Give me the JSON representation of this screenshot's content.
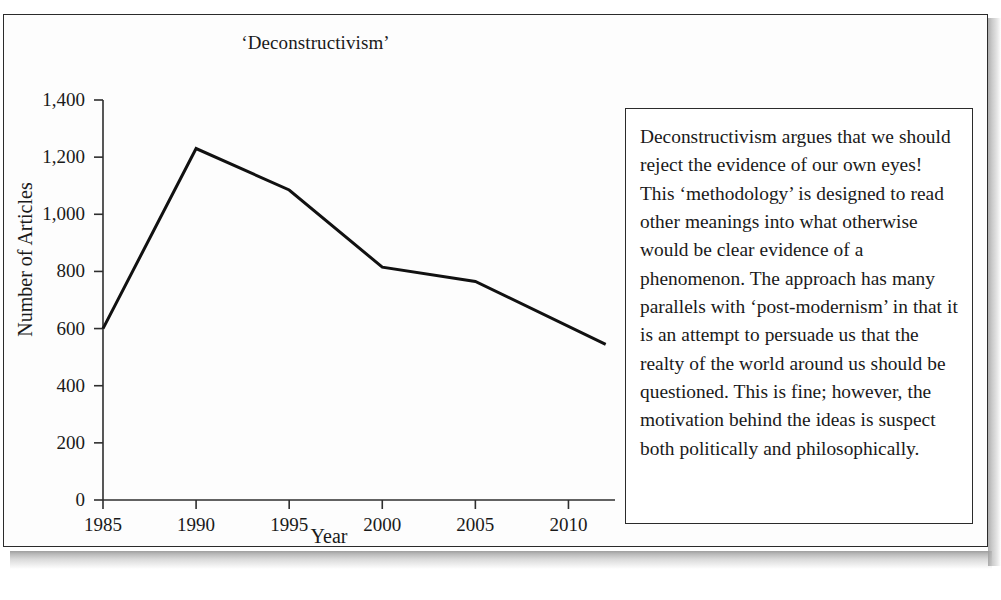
{
  "figure": {
    "title": "‘Deconstructivism’",
    "sidebar_text": "Deconstructivism argues that we should reject the evidence of our own eyes! This ‘methodology’ is designed to read other meanings into what otherwise would be clear evidence of a phenomenon. The approach has many parallels with ‘post-modernism’ in that it is an attempt to persuade us that the realty of the world around us should be questioned. This is fine; however, the motivation behind the ideas is suspect both politically and philosophically."
  },
  "chart_data": {
    "type": "line",
    "title": "‘Deconstructivism’",
    "xlabel": "Year",
    "ylabel": "Number of Articles",
    "x": [
      1985,
      1990,
      1995,
      2000,
      2005,
      2012
    ],
    "values": [
      600,
      1230,
      1085,
      815,
      765,
      545
    ],
    "series": [
      {
        "name": "Number of Articles",
        "values": [
          600,
          1230,
          1085,
          815,
          765,
          545
        ]
      }
    ],
    "xlim": [
      1985,
      2012.5
    ],
    "ylim": [
      0,
      1400
    ],
    "xticks": [
      1985,
      1990,
      1995,
      2000,
      2005,
      2010
    ],
    "xtick_labels": [
      "1985",
      "1990",
      "1995",
      "2000",
      "2005",
      "2010"
    ],
    "yticks": [
      0,
      200,
      400,
      600,
      800,
      1000,
      1200,
      1400
    ],
    "ytick_labels": [
      "0",
      "200",
      "400",
      "600",
      "800",
      "1,000",
      "1,200",
      "1,400"
    ],
    "grid": false,
    "legend": false,
    "line_color": "#111111",
    "line_width": 3
  }
}
